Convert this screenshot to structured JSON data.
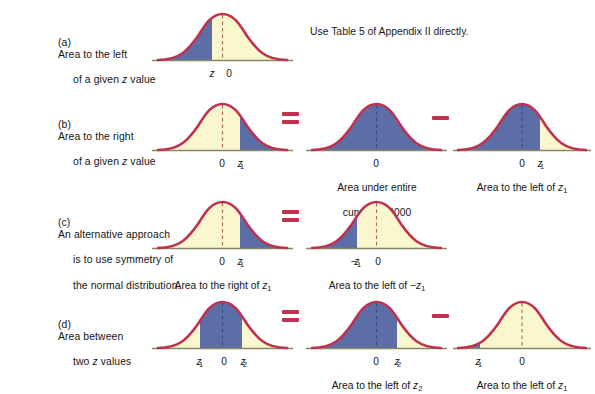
{
  "figure": {
    "colors": {
      "curve_stroke": "#c0304f",
      "fill_blue": "#5b6ea8",
      "fill_cream": "#faf6cd",
      "axis": "#8a8663",
      "center_dash": "#a86b52",
      "operator": "#c0304f",
      "text": "#141414",
      "background": "#ffffff"
    },
    "rows": [
      {
        "id": "a",
        "label_tag": "(a)",
        "label_text": "Area to the left\nof a given z value",
        "note": "Use Table 5 of Appendix II directly.",
        "panels": [
          {
            "id": "a1",
            "shade": "left-of-z",
            "axis_labels": [
              "z",
              "0"
            ],
            "caption": ""
          }
        ],
        "operators": []
      },
      {
        "id": "b",
        "label_tag": "(b)",
        "label_text": "Area to the right\nof a given z value",
        "note": "",
        "panels": [
          {
            "id": "b1",
            "shade": "right-of-z1",
            "axis_labels": [
              "0",
              "z1"
            ],
            "caption": ""
          },
          {
            "id": "b2",
            "shade": "entire",
            "axis_labels": [
              "0"
            ],
            "caption": "Area under entire\ncurve = 1.0000"
          },
          {
            "id": "b3",
            "shade": "left-of-z1",
            "axis_labels": [
              "0",
              "z1"
            ],
            "caption": "Area to the left of z1"
          }
        ],
        "operators": [
          "=",
          "−"
        ]
      },
      {
        "id": "c",
        "label_tag": "(c)",
        "label_text": "An alternative approach\nis to use symmetry of\nthe normal distribution.",
        "note": "",
        "panels": [
          {
            "id": "c1",
            "shade": "right-of-z1",
            "axis_labels": [
              "0",
              "z1"
            ],
            "caption": "Area to the right of z1"
          },
          {
            "id": "c2",
            "shade": "left-of-negz1",
            "axis_labels": [
              "−z1",
              "0"
            ],
            "caption": "Area to the left of −z1"
          }
        ],
        "operators": [
          "="
        ]
      },
      {
        "id": "d",
        "label_tag": "(d)",
        "label_text": "Area between\ntwo z values",
        "note": "",
        "panels": [
          {
            "id": "d1",
            "shade": "between-z1-z2",
            "axis_labels": [
              "z1",
              "0",
              "z2"
            ],
            "caption": ""
          },
          {
            "id": "d2",
            "shade": "left-of-z2",
            "axis_labels": [
              "0",
              "z2"
            ],
            "caption": "Area to the left of z2"
          },
          {
            "id": "d3",
            "shade": "left-of-z1-narrow",
            "axis_labels": [
              "z1",
              "0"
            ],
            "caption": "Area to the left of z1"
          }
        ],
        "operators": [
          "=",
          "−"
        ]
      }
    ],
    "axis_symbols": {
      "zero": "0",
      "z": "z",
      "z1": "z",
      "z1_sub": "1",
      "z2": "z",
      "z2_sub": "2",
      "neg_z1": "−z",
      "neg_z1_sub": "1"
    },
    "captions": {
      "entire_curve_line1": "Area under entire",
      "entire_curve_line2": "curve = 1.0000",
      "left_of_z1": "Area to the left of ",
      "left_of_z2": "Area to the left of ",
      "right_of_z1": "Area to the right of ",
      "left_of_neg_z1": "Area to the left of "
    },
    "operator_glyphs": {
      "equals": "=",
      "minus": "−"
    }
  }
}
